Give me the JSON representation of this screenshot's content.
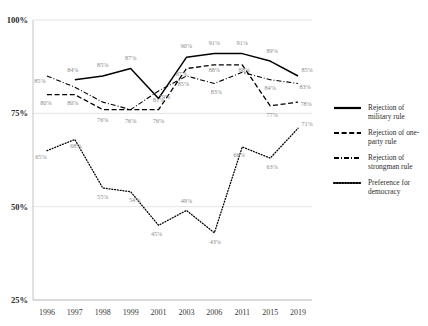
{
  "chart_data": {
    "type": "line",
    "title": "",
    "xlabel": "",
    "ylabel": "",
    "categories": [
      "1996",
      "1997",
      "1998",
      "1999",
      "2001",
      "2003",
      "2006",
      "2011",
      "2015",
      "2019"
    ],
    "ylim": [
      25,
      100
    ],
    "yticks": [
      "25%",
      "50%",
      "75%",
      "100%"
    ],
    "ytick_values": [
      25,
      50,
      75,
      100
    ],
    "grid": true,
    "legend_position": "right",
    "series": [
      {
        "name": "Rejection of military rule",
        "style": "solid",
        "values": [
          null,
          84,
          85,
          87,
          79,
          90,
          91,
          91,
          89,
          85
        ],
        "labels": [
          "",
          "84%",
          "85%",
          "87%",
          "79%",
          "90%",
          "91%",
          "91%",
          "89%",
          "85%"
        ]
      },
      {
        "name": "Rejection of one-party rule",
        "style": "dashed",
        "values": [
          80,
          80,
          76,
          76,
          76,
          87,
          88,
          88,
          77,
          78
        ],
        "labels": [
          "80%",
          "80%",
          "76%",
          "76%",
          "76%",
          "87%",
          "88%",
          "88%",
          "77%",
          "78%"
        ]
      },
      {
        "name": "Rejection of strongman rule",
        "style": "dashdot",
        "values": [
          85,
          82,
          78,
          76,
          81,
          85,
          83,
          86,
          84,
          83
        ],
        "labels": [
          "85%",
          "",
          "",
          "",
          "81%",
          "85%",
          "83%",
          "",
          "84%",
          "83%"
        ]
      },
      {
        "name": "Preference for democracy",
        "style": "dotted",
        "values": [
          65,
          68,
          55,
          54,
          45,
          49,
          43,
          66,
          63,
          71
        ],
        "labels": [
          "65%",
          "68%",
          "55%",
          "54%",
          "45%",
          "49%",
          "43%",
          "66%",
          "63%",
          "71%"
        ]
      }
    ]
  },
  "legend": {
    "items": [
      {
        "label_line1": "Rejection of",
        "label_line2": "military rule",
        "style": "solid"
      },
      {
        "label_line1": "Rejection of one-",
        "label_line2": "party rule",
        "style": "dashed"
      },
      {
        "label_line1": "Rejection of",
        "label_line2": "strongman rule",
        "style": "dashdot"
      },
      {
        "label_line1": "Preference for",
        "label_line2": "democracy",
        "style": "dotted"
      }
    ]
  },
  "axes": {
    "y_top": "100%",
    "y_mid_high": "75%",
    "y_mid_low": "50%",
    "y_bottom": "25%"
  },
  "colors": {
    "line": "#000000",
    "grid": "#d9d9d9",
    "label_text": "#8a8a8a",
    "axis_text": "#2b2b2b"
  }
}
